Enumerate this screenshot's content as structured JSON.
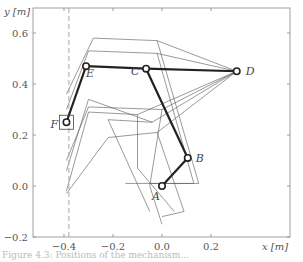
{
  "chart_data": {
    "type": "line",
    "title": "",
    "xlabel": "x [m]",
    "ylabel": "y [m]",
    "xlim": [
      -0.48,
      0.52
    ],
    "ylim": [
      -0.2,
      0.7
    ],
    "xticks": [
      -0.4,
      -0.2,
      0.0,
      0.2
    ],
    "yticks": [
      -0.2,
      0.0,
      0.2,
      0.4,
      0.6
    ],
    "xtick_labels": [
      "−0.4",
      "−0.2",
      "0.0",
      "0.2"
    ],
    "ytick_labels": [
      "−0.2",
      "0.0",
      "0.2",
      "0.4",
      "0.6"
    ],
    "grid": false,
    "constraint_line": {
      "x": -0.38,
      "style": "dashed",
      "color": "#aaaaaa"
    },
    "mechanism": {
      "joints": [
        {
          "name": "A",
          "x": 0.0,
          "y": 0.0
        },
        {
          "name": "B",
          "x": 0.105,
          "y": 0.11
        },
        {
          "name": "C",
          "x": -0.065,
          "y": 0.46
        },
        {
          "name": "D",
          "x": 0.305,
          "y": 0.45
        },
        {
          "name": "E",
          "x": -0.31,
          "y": 0.47
        },
        {
          "name": "F",
          "x": -0.39,
          "y": 0.25
        }
      ],
      "links": [
        [
          "A",
          "B"
        ],
        [
          "B",
          "C"
        ],
        [
          "C",
          "D"
        ],
        [
          "C",
          "E"
        ],
        [
          "E",
          "F"
        ]
      ],
      "color": "#222222"
    },
    "ghost_configurations": [
      [
        [
          -0.05,
          -0.1
        ],
        [
          -0.22,
          0.26
        ],
        [
          -0.04,
          0.25
        ],
        [
          0.305,
          0.45
        ],
        [
          -0.3,
          0.34
        ],
        [
          -0.39,
          0.06
        ]
      ],
      [
        [
          0.05,
          -0.1
        ],
        [
          -0.1,
          0.07
        ],
        [
          -0.1,
          0.28
        ],
        [
          0.305,
          0.45
        ],
        [
          -0.3,
          0.29
        ],
        [
          -0.39,
          -0.02
        ]
      ],
      [
        [
          -0.15,
          0.01
        ],
        [
          0.15,
          0.01
        ],
        [
          -0.02,
          0.57
        ],
        [
          0.305,
          0.45
        ],
        [
          -0.28,
          0.58
        ],
        [
          -0.39,
          0.36
        ]
      ],
      [
        [
          -0.05,
          0.01
        ],
        [
          0.13,
          0.01
        ],
        [
          -0.02,
          0.52
        ],
        [
          0.305,
          0.45
        ],
        [
          -0.3,
          0.53
        ],
        [
          -0.39,
          0.3
        ]
      ],
      [
        [
          0.0,
          -0.12
        ],
        [
          0.09,
          -0.1
        ],
        [
          -0.02,
          0.21
        ],
        [
          0.305,
          0.45
        ],
        [
          -0.22,
          0.19
        ],
        [
          -0.39,
          -0.03
        ]
      ],
      [
        [
          0.0,
          -0.15
        ],
        [
          -0.05,
          0.0
        ],
        [
          0.0,
          0.3
        ],
        [
          0.305,
          0.45
        ],
        [
          -0.3,
          0.31
        ],
        [
          -0.39,
          0.1
        ]
      ]
    ],
    "ghost_color": "#555555"
  },
  "caption": "Figure 4.3: Positions of the mechanism..."
}
